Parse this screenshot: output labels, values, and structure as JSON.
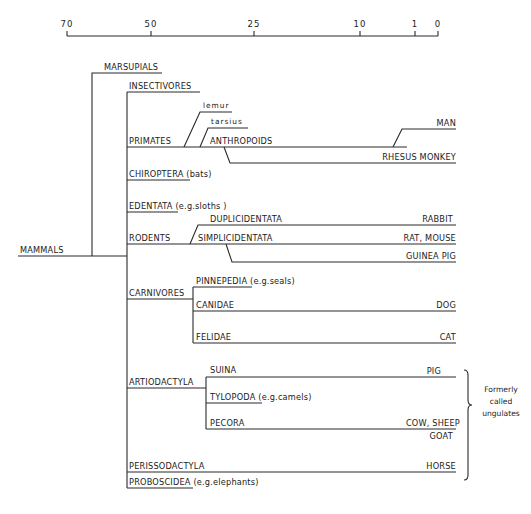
{
  "axis": {
    "y": 36,
    "x_start": 67,
    "x_end": 438,
    "ticks": [
      {
        "label": "70",
        "x": 67
      },
      {
        "label": "50",
        "x": 151
      },
      {
        "label": "25",
        "x": 254
      },
      {
        "label": "10",
        "x": 360
      },
      {
        "label": "1",
        "x": 415
      },
      {
        "label": "0",
        "x": 438
      }
    ]
  },
  "labels": {
    "mammals": "MAMMALS",
    "marsupials": "MARSUPIALS",
    "insectivores": "INSECTIVORES",
    "primates": "PRIMATES",
    "lemur": "lemur",
    "tarsius": "tarsius",
    "anthropoids": "ANTHROPOIDS",
    "man": "MAN",
    "rhesus": "RHESUS MONKEY",
    "chiroptera": "CHIROPTERA (bats)",
    "edentata": "EDENTATA (e.g.sloths )",
    "rodents": "RODENTS",
    "duplicidentata": "DUPLICIDENTATA",
    "simplicidentata": "SIMPLICIDENTATA",
    "rabbit": "RABBIT",
    "rat_mouse": "RAT, MOUSE",
    "guinea_pig": "GUINEA PIG",
    "carnivores": "CARNIVORES",
    "pinnepedia": "PINNEPEDIA (e.g.seals)",
    "canidae": "CANIDAE",
    "dog": "DOG",
    "felidae": "FELIDAE",
    "cat": "CAT",
    "artiodactyla": "ARTIODACTYLA",
    "suina": "SUINA",
    "pig": "PIG",
    "tylopoda": "TYLOPODA (e.g.camels)",
    "pecora": "PECORA",
    "cow_sheep": "COW, SHEEP",
    "goat": "GOAT",
    "perissodactyla": "PERISSODACTYLA",
    "horse": "HORSE",
    "proboscidea": "PROBOSCIDEA (e.g.elephants)"
  },
  "annotation": {
    "line1": "Formerly",
    "line2": "called",
    "line3": "ungulates"
  },
  "tree": {
    "root": "MAMMALS",
    "children": [
      {
        "name": "MARSUPIALS"
      },
      {
        "name": "Placentals",
        "children": [
          {
            "name": "INSECTIVORES"
          },
          {
            "name": "PRIMATES",
            "children": [
              {
                "name": "lemur"
              },
              {
                "name": "tarsius"
              },
              {
                "name": "ANTHROPOIDS",
                "children": [
                  {
                    "name": "MAN"
                  },
                  {
                    "name": "RHESUS MONKEY"
                  }
                ]
              }
            ]
          },
          {
            "name": "CHIROPTERA (bats)"
          },
          {
            "name": "EDENTATA (e.g.sloths)"
          },
          {
            "name": "RODENTS",
            "children": [
              {
                "name": "DUPLICIDENTATA",
                "children": [
                  {
                    "name": "RABBIT"
                  }
                ]
              },
              {
                "name": "SIMPLICIDENTATA",
                "children": [
                  {
                    "name": "RAT, MOUSE"
                  },
                  {
                    "name": "GUINEA PIG"
                  }
                ]
              }
            ]
          },
          {
            "name": "CARNIVORES",
            "children": [
              {
                "name": "PINNEPEDIA (e.g.seals)"
              },
              {
                "name": "CANIDAE",
                "children": [
                  {
                    "name": "DOG"
                  }
                ]
              },
              {
                "name": "FELIDAE",
                "children": [
                  {
                    "name": "CAT"
                  }
                ]
              }
            ]
          },
          {
            "name": "ARTIODACTYLA",
            "children": [
              {
                "name": "SUINA",
                "children": [
                  {
                    "name": "PIG"
                  }
                ]
              },
              {
                "name": "TYLOPODA (e.g.camels)"
              },
              {
                "name": "PECORA",
                "children": [
                  {
                    "name": "COW, SHEEP GOAT"
                  }
                ]
              }
            ]
          },
          {
            "name": "PERISSODACTYLA",
            "children": [
              {
                "name": "HORSE"
              }
            ]
          },
          {
            "name": "PROBOSCIDEA (e.g.elephants)"
          }
        ]
      }
    ]
  }
}
